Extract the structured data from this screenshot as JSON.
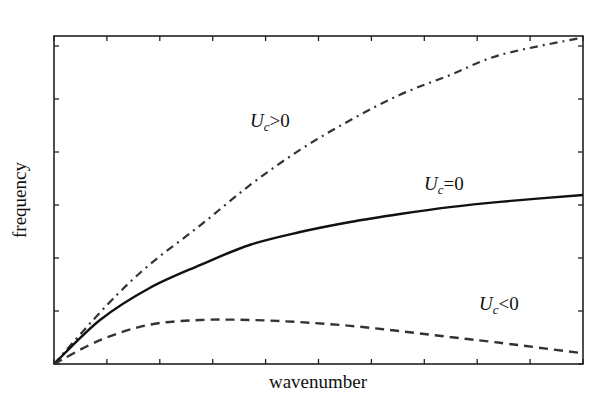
{
  "chart_data": {
    "type": "line",
    "title": "",
    "xlabel": "wavenumber",
    "ylabel": "frequency",
    "xlim": [
      0,
      10
    ],
    "ylim": [
      0,
      6.2
    ],
    "grid": false,
    "legend": "none (inline curve annotations)",
    "x_ticks_count": 11,
    "y_ticks_count": 7,
    "tick_labels_shown": false,
    "series": [
      {
        "name": "U_c>0",
        "style": "dash-dot",
        "x": [
          0,
          1,
          1.8,
          2.77,
          3.71,
          4.65,
          5.6,
          6.54,
          7.48,
          8.43,
          9.94
        ],
        "y": [
          0,
          1.11,
          1.87,
          2.62,
          3.38,
          4.04,
          4.6,
          5.08,
          5.45,
          5.83,
          6.15
        ]
      },
      {
        "name": "U_c=0",
        "style": "solid",
        "x": [
          0,
          0.87,
          1.8,
          2.77,
          3.71,
          4.65,
          5.6,
          6.54,
          7.48,
          8.43,
          10
        ],
        "y": [
          0,
          0.83,
          1.43,
          1.87,
          2.25,
          2.49,
          2.68,
          2.83,
          2.96,
          3.06,
          3.19
        ]
      },
      {
        "name": "U_c<0",
        "style": "dashed",
        "x": [
          0,
          0.87,
          1.8,
          2.77,
          3.71,
          4.65,
          5.6,
          6.54,
          7.48,
          8.43,
          9.94
        ],
        "y": [
          0,
          0.45,
          0.74,
          0.83,
          0.83,
          0.79,
          0.72,
          0.62,
          0.51,
          0.4,
          0.21
        ]
      }
    ],
    "annotations": [
      {
        "text": "U_c>0",
        "near_series": "U_c>0"
      },
      {
        "text": "U_c=0",
        "near_series": "U_c=0"
      },
      {
        "text": "U_c<0",
        "near_series": "U_c<0"
      }
    ]
  },
  "labels": {
    "xlabel": "wavenumber",
    "ylabel": "frequency",
    "ann_pos": {
      "var": "U",
      "sub": "c",
      "rel": ">0"
    },
    "ann_zero": {
      "var": "U",
      "sub": "c",
      "rel": "=0"
    },
    "ann_neg": {
      "var": "U",
      "sub": "c",
      "rel": "<0"
    }
  }
}
